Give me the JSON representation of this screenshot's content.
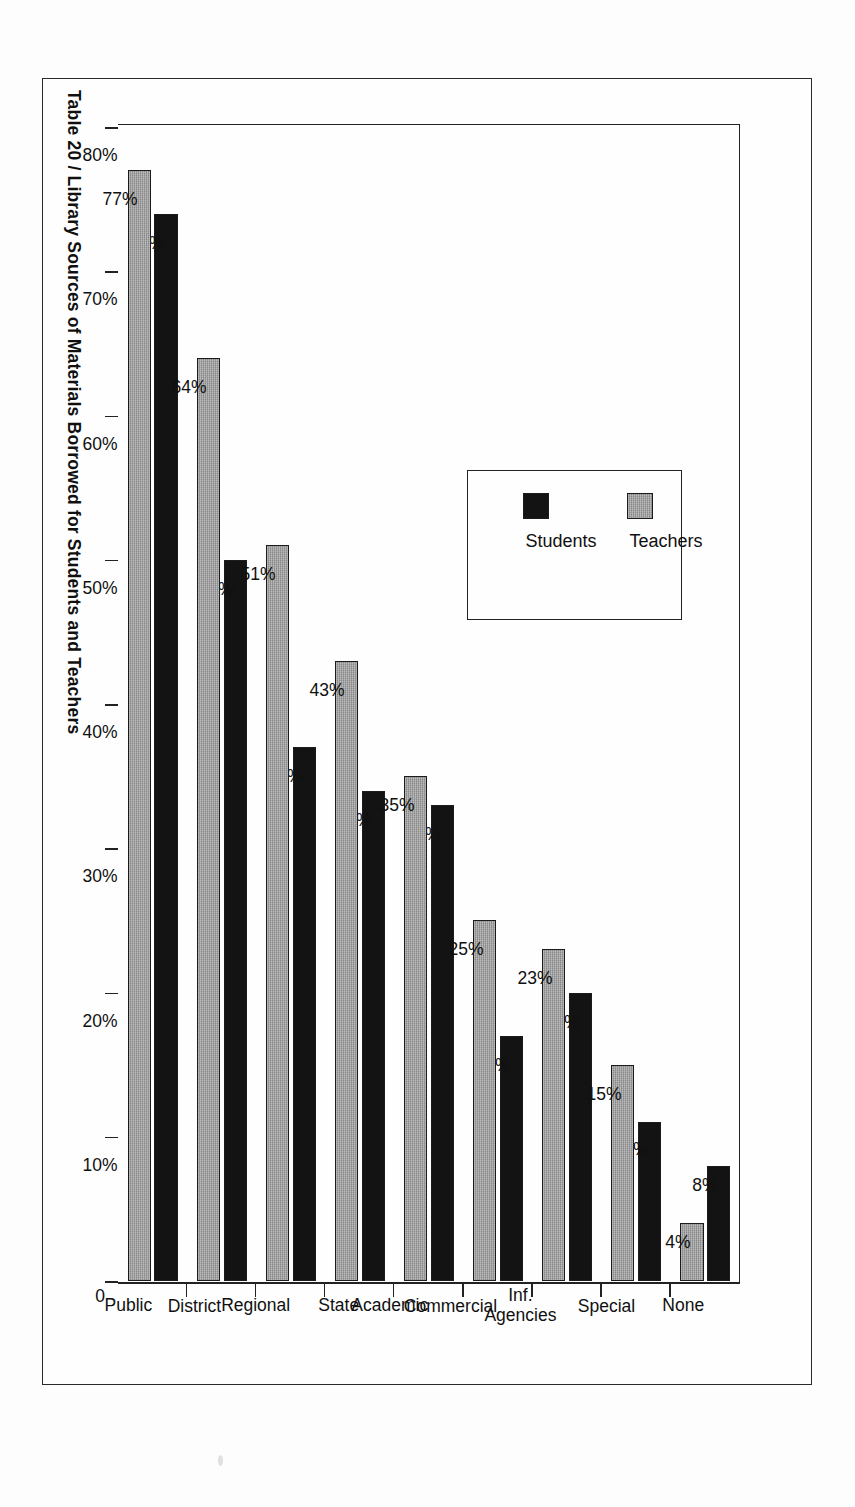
{
  "page": {
    "background_color": "#fdfdfd",
    "frame_color": "#2a2a2a"
  },
  "chart_title": "Table 20  /  Library Sources of Materials Borrowed for Students and Teachers",
  "legend": {
    "position": "inside-plot-upper-left",
    "entries": [
      {
        "label": "Teachers",
        "color": "#9b9b9b",
        "swatch": "gray-hatched-swatch"
      },
      {
        "label": "Students",
        "color": "#131313",
        "swatch": "black-swatch"
      }
    ]
  },
  "axis": {
    "orientation": "horizontal-bars-rotated-page",
    "ticks": [
      "80%",
      "70%",
      "60%",
      "50%",
      "40%",
      "30%",
      "20%",
      "10%",
      "0"
    ],
    "tick_values": [
      80,
      70,
      60,
      50,
      40,
      30,
      20,
      10,
      0
    ],
    "max": 80,
    "min": 0
  },
  "chart_data": {
    "type": "bar",
    "title": "Table 20  /  Library Sources of Materials Borrowed for Students and Teachers",
    "xlabel": "",
    "ylabel": "",
    "orientation": "horizontal",
    "grid": false,
    "legend_position": "inside upper-left of plot",
    "ylim": [
      0,
      80
    ],
    "tick_labels": [
      "80%",
      "70%",
      "60%",
      "50%",
      "40%",
      "30%",
      "20%",
      "10%",
      "0"
    ],
    "categories": [
      "Public",
      "District",
      "Regional",
      "State",
      "Academic",
      "Commercial",
      "Inf. Agencies",
      "Special",
      "None"
    ],
    "series": [
      {
        "name": "Teachers",
        "color": "#9b9b9b",
        "values": [
          77,
          64,
          51,
          43,
          35,
          25,
          23,
          15,
          4
        ],
        "value_labels": [
          "77%",
          "64%",
          "51%",
          "43%",
          "35%",
          "25%",
          "23%",
          "15%",
          "4%"
        ]
      },
      {
        "name": "Students",
        "color": "#131313",
        "values": [
          74,
          50,
          37,
          34,
          33,
          17,
          20,
          11,
          8
        ],
        "value_labels": [
          "74%",
          "50%",
          "37%",
          "34%",
          "33%",
          "17%",
          "20%",
          "11%",
          "8%"
        ]
      }
    ]
  },
  "category_labels": [
    {
      "lines": [
        "None"
      ]
    },
    {
      "lines": [
        "Special"
      ]
    },
    {
      "lines": [
        "Inf.",
        "Agencies"
      ]
    },
    {
      "lines": [
        "Commercial"
      ]
    },
    {
      "lines": [
        "Academic"
      ]
    },
    {
      "lines": [
        "State"
      ]
    },
    {
      "lines": [
        "Regional"
      ]
    },
    {
      "lines": [
        "District"
      ]
    },
    {
      "lines": [
        "Public"
      ]
    }
  ]
}
